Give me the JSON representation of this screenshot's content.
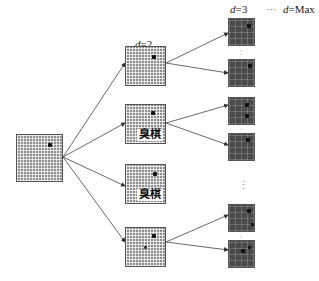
{
  "diagram": {
    "type": "search-tree",
    "depth_labels": {
      "d2": {
        "var": "d",
        "eq": "=2"
      },
      "d3": {
        "var": "d",
        "eq": "=3"
      },
      "ellipsis": "···",
      "dmax": {
        "var": "d",
        "eq": "=Max"
      }
    },
    "root": {
      "id": "root",
      "style": "light-grid"
    },
    "level2": [
      {
        "id": "n2-1",
        "style": "light-grid",
        "tag": ""
      },
      {
        "id": "n2-2",
        "style": "light-grid",
        "tag": "臭棋"
      },
      {
        "id": "n2-3",
        "style": "light-grid",
        "tag": "臭棋"
      },
      {
        "id": "n2-4",
        "style": "light-grid",
        "tag": ""
      }
    ],
    "level3": [
      {
        "id": "n3-1",
        "style": "dark-grid"
      },
      {
        "id": "n3-2",
        "style": "dark-grid"
      },
      {
        "id": "n3-3",
        "style": "dark-grid"
      },
      {
        "id": "n3-4",
        "style": "dark-grid"
      },
      {
        "id": "n3-5",
        "style": "dark-grid"
      },
      {
        "id": "n3-6",
        "style": "dark-grid"
      }
    ],
    "vertical_ellipsis": "⋮",
    "colors": {
      "edge": "#444444",
      "light_grid": "#8e8e8e",
      "dark_grid": "#4a4a4a",
      "stone": "#111111"
    }
  }
}
